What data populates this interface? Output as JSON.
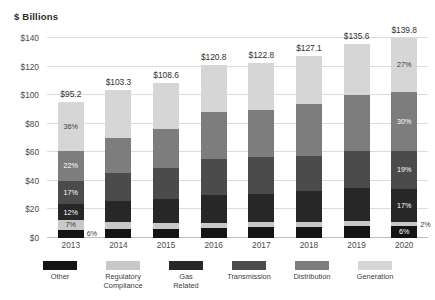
{
  "chart_data": {
    "type": "bar",
    "subtype": "stacked-column",
    "title": "$ Billions",
    "xlabel": "",
    "ylabel": "$ Billions",
    "ylim": [
      0,
      140
    ],
    "ytick_values": [
      0,
      20,
      40,
      60,
      80,
      100,
      120,
      140
    ],
    "ytick_labels": [
      "$0",
      "$20",
      "$40",
      "$60",
      "$80",
      "$100",
      "$120",
      "$140"
    ],
    "grid": true,
    "legend_position": "bottom",
    "categories": [
      "2013",
      "2014",
      "2015",
      "2016",
      "2017",
      "2018",
      "2019",
      "2020"
    ],
    "totals": [
      95.2,
      103.3,
      108.6,
      120.8,
      122.8,
      127.1,
      135.6,
      139.8
    ],
    "total_labels": [
      "$95.2",
      "$103.3",
      "$108.6",
      "$120.8",
      "$122.8",
      "$127.1",
      "$135.6",
      "$139.8"
    ],
    "series": [
      {
        "name": "Other",
        "color": "#141414",
        "values": [
          5.7,
          6.2,
          6.5,
          7.2,
          7.4,
          7.6,
          8.1,
          8.4
        ],
        "percent_labels": [
          "6%",
          "",
          "",
          "",
          "",
          "",
          "",
          "6%"
        ]
      },
      {
        "name": "Regulatory Compliance",
        "color": "#c8c8c8",
        "values": [
          6.7,
          5.2,
          4.3,
          3.6,
          3.7,
          3.8,
          4.1,
          2.8
        ],
        "percent_labels": [
          "7%",
          "",
          "",
          "",
          "",
          "",
          "",
          "2%"
        ]
      },
      {
        "name": "Gas Related",
        "color": "#272727",
        "values": [
          11.4,
          14.5,
          16.3,
          19.3,
          19.6,
          21.6,
          23.1,
          23.8
        ],
        "percent_labels": [
          "12%",
          "",
          "",
          "",
          "",
          "",
          "",
          "17%"
        ]
      },
      {
        "name": "Transmission",
        "color": "#4b4b4b",
        "values": [
          16.2,
          19.6,
          21.7,
          25.4,
          26.0,
          24.1,
          25.8,
          26.6
        ],
        "percent_labels": [
          "17%",
          "",
          "",
          "",
          "",
          "",
          "",
          "19%"
        ]
      },
      {
        "name": "Distribution",
        "color": "#7d7d7d",
        "values": [
          20.9,
          24.8,
          27.2,
          32.6,
          33.2,
          36.9,
          39.3,
          41.9
        ],
        "percent_labels": [
          "22%",
          "",
          "",
          "",
          "",
          "",
          "",
          "30%"
        ]
      },
      {
        "name": "Generation",
        "color": "#d6d6d6",
        "values": [
          34.3,
          33.0,
          32.6,
          32.7,
          32.9,
          33.1,
          35.2,
          37.7
        ],
        "percent_labels": [
          "36%",
          "",
          "",
          "",
          "",
          "",
          "",
          "27%"
        ]
      }
    ]
  }
}
